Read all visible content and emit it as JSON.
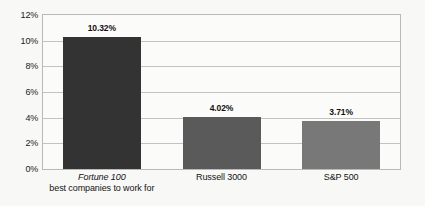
{
  "chart_data": {
    "type": "bar",
    "title": "",
    "subtitle": "",
    "xlabel": "",
    "ylabel": "",
    "categories": [
      {
        "line1": "Fortune 100",
        "line1_style": "italic",
        "line2": "best companies to work for"
      },
      {
        "line1": "Russell 3000",
        "line1_style": "normal",
        "line2": ""
      },
      {
        "line1": "S&P 500",
        "line1_style": "normal",
        "line2": ""
      }
    ],
    "values": [
      10.32,
      4.02,
      3.71
    ],
    "value_labels": [
      "10.32%",
      "4.02%",
      "3.71%"
    ],
    "bar_colors": [
      "#333333",
      "#5a5a5a",
      "#787878"
    ],
    "ylim": [
      0,
      12
    ],
    "ytick_values": [
      0,
      2,
      4,
      6,
      8,
      10,
      12
    ],
    "ytick_labels": [
      "0%",
      "2%",
      "4%",
      "6%",
      "8%",
      "10%",
      "12%"
    ],
    "grid": true,
    "grid_axis": "y",
    "legend": false,
    "legend_position": "none",
    "plot_background": "#fbfbfa",
    "canvas_background": "#f8f8f7",
    "border_color": "#b9b9b9",
    "gridline_color": "#c3c3c3"
  }
}
